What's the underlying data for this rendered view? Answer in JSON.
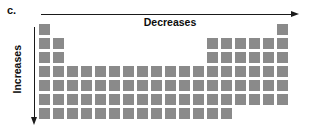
{
  "figure": {
    "panel_label": "c.",
    "horizontal_axis": {
      "label": "Decreases",
      "direction": "right",
      "arrow_icon": "right-arrow-icon"
    },
    "vertical_axis": {
      "label": "Increases",
      "direction": "down",
      "arrow_icon": "down-arrow-icon"
    },
    "colors": {
      "cell_fill": "#8a8a8a",
      "arrow": "#1a1a1a",
      "text": "#0d0d0d",
      "background": "#ffffff"
    }
  },
  "chart_data": {
    "type": "heatmap",
    "title": "",
    "xlabel": "Decreases",
    "ylabel": "Increases",
    "grid": false,
    "legend": "none",
    "columns": 18,
    "rows": 7,
    "cell_size_px": 11,
    "cell_pitch_px": 14,
    "occupied_columns_by_row": [
      [
        1,
        18
      ],
      [
        1,
        2,
        13,
        14,
        15,
        16,
        17,
        18
      ],
      [
        1,
        2,
        13,
        14,
        15,
        16,
        17,
        18
      ],
      [
        1,
        2,
        3,
        4,
        5,
        6,
        7,
        8,
        9,
        10,
        11,
        12,
        13,
        14,
        15,
        16,
        17,
        18
      ],
      [
        1,
        2,
        3,
        4,
        5,
        6,
        7,
        8,
        9,
        10,
        11,
        12,
        13,
        14,
        15,
        16,
        17,
        18
      ],
      [
        1,
        2,
        3,
        4,
        5,
        6,
        7,
        8,
        9,
        10,
        11,
        12,
        13,
        14,
        15,
        16,
        17,
        18
      ],
      [
        1,
        2,
        3,
        4,
        5,
        6,
        7,
        8,
        9,
        10,
        11,
        12,
        13,
        14
      ]
    ]
  }
}
